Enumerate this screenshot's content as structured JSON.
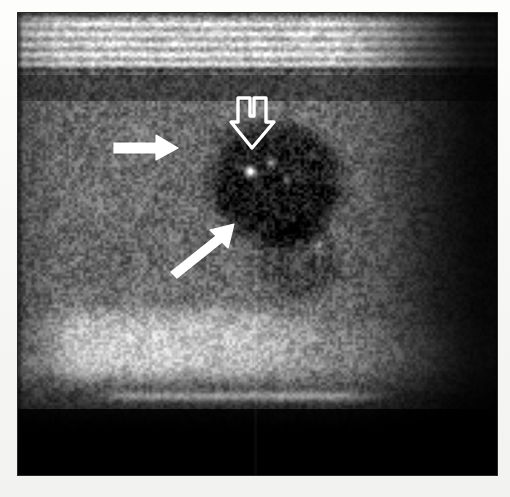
{
  "page": {
    "background_color": "#fbfbfa",
    "width": 510,
    "height": 497
  },
  "image": {
    "kind": "ultrasound-bmode",
    "alt_text": "Grayscale B-mode ultrasound image",
    "frame": {
      "x": 18,
      "y": 13,
      "width": 479,
      "height": 462
    },
    "background_color": "#000000",
    "border_color": "#2a2a2a",
    "has_text_overlay": false,
    "seam_x": 255
  },
  "regions": [
    {
      "name": "superficial-bright-band",
      "description": "Bright horizontal striated near-field layers (skin / subcutaneous tissue)",
      "y_start": 0,
      "y_end": 48,
      "brightness": "high"
    },
    {
      "name": "hypoechoic-dark-band",
      "description": "Dark band beneath the superficial layers",
      "y_start": 48,
      "y_end": 88,
      "brightness": "low"
    },
    {
      "name": "parenchyma-speckle",
      "description": "Mid-gray speckled parenchyma occupying the mid field",
      "y_start": 88,
      "y_end": 300,
      "brightness": "medium"
    },
    {
      "name": "hypoechoic-lesion",
      "description": "Rounded hypoechoic nodule in the central mid field with internal punctate echogenic focus",
      "cx": 258,
      "cy": 170,
      "rx": 78,
      "ry": 72,
      "brightness": "very-low"
    },
    {
      "name": "punctate-calcification",
      "description": "Bright punctate echogenic focus inside the nodule",
      "cx": 232,
      "cy": 158,
      "r": 6,
      "brightness": "very-high"
    },
    {
      "name": "deep-bright-speckle",
      "description": "Bright speckled band in the lower-left and lower-central field",
      "y_start": 288,
      "y_end": 378,
      "brightness": "high"
    },
    {
      "name": "bright-linear-streak",
      "description": "Bright horizontal linear echo near the lower field",
      "y_start": 378,
      "y_end": 396,
      "brightness": "high"
    },
    {
      "name": "acoustic-shadow-right",
      "description": "Dark right-lateral field with posterior signal dropout",
      "x_start": 330,
      "brightness": "very-low"
    },
    {
      "name": "far-field-dropout",
      "description": "Black far field below the bright linear echo",
      "y_start": 396,
      "y_end": 462,
      "brightness": "none"
    }
  ],
  "annotations": {
    "color": "#ffffff",
    "markers": [
      {
        "id": "arrow-left",
        "name": "solid-arrow-left",
        "style": "solid",
        "direction": "right",
        "points_at": "hypoechoic-lesion",
        "x": 112,
        "y": 130,
        "width": 70,
        "height": 38
      },
      {
        "id": "arrow-hollow",
        "name": "hollow-arrow-top",
        "style": "hollow-outline",
        "direction": "down",
        "points_at": "punctate-calcification",
        "x": 228,
        "y": 92,
        "width": 56,
        "height": 60
      },
      {
        "id": "arrow-lower",
        "name": "solid-arrow-lower",
        "style": "solid",
        "direction": "up-right",
        "points_at": "hypoechoic-lesion",
        "x": 168,
        "y": 218,
        "width": 72,
        "height": 58
      }
    ]
  }
}
